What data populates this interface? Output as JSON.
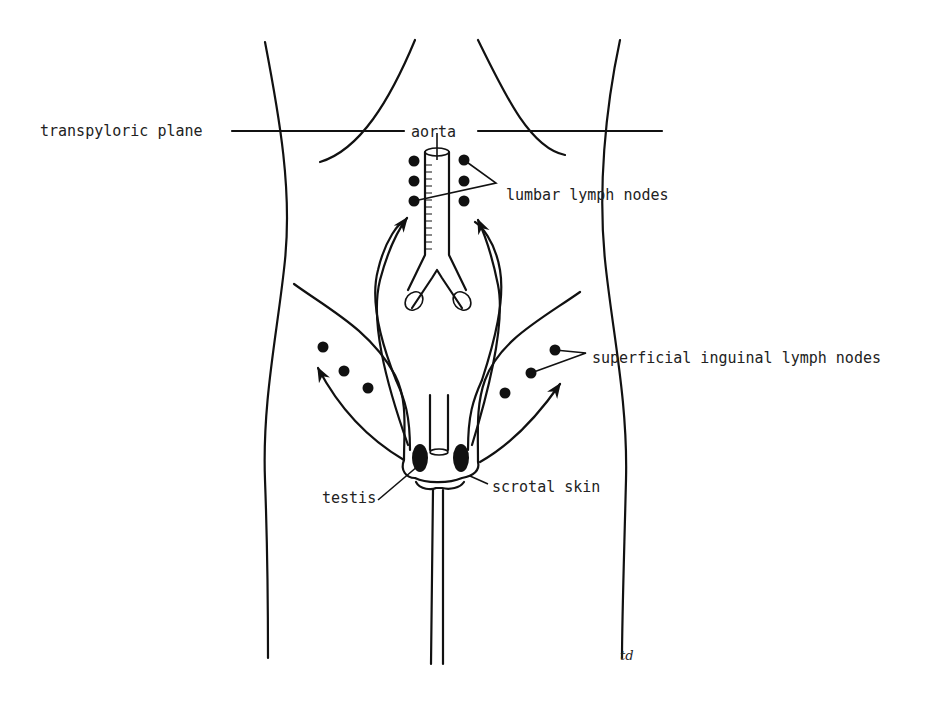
{
  "figure": {
    "type": "anatomical line diagram",
    "labels": {
      "transpyloric_plane": "transpyloric plane",
      "aorta": "aorta",
      "lumbar_lymph_nodes": "lumbar lymph nodes",
      "superficial_inguinal_lymph_nodes": "superficial inguinal lymph nodes",
      "testis": "testis",
      "scrotal_skin": "scrotal skin",
      "signature": "td"
    },
    "structures": [
      {
        "name": "aorta",
        "count": 1
      },
      {
        "name": "lumbar lymph nodes",
        "count": 6
      },
      {
        "name": "superficial inguinal lymph nodes",
        "count": 6
      },
      {
        "name": "testis",
        "count": 2
      }
    ],
    "drainage_arrows": [
      {
        "from": "testis",
        "to": "lumbar lymph nodes",
        "count": 2
      },
      {
        "from": "scrotal skin",
        "to": "superficial inguinal lymph nodes",
        "count": 2
      }
    ],
    "colors": {
      "ink": "#111111",
      "background": "#ffffff"
    }
  }
}
